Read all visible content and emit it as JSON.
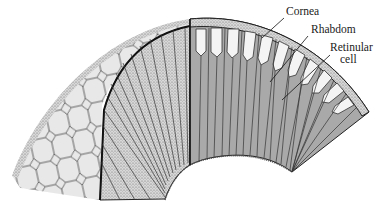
{
  "figure": {
    "labels": [
      {
        "id": "cornea",
        "text": "Cornea",
        "x": 286,
        "y": 12
      },
      {
        "id": "rhabdom",
        "text": "Rhabdom",
        "x": 310,
        "y": 30
      },
      {
        "id": "retinular",
        "text": "Retinular",
        "x": 330,
        "y": 47
      },
      {
        "id": "retinular2",
        "text": "cell",
        "x": 340,
        "y": 59
      }
    ],
    "colors": {
      "ink": "#2a2a2a",
      "hex_fill": "#e6e6e6",
      "stipple": "#bdbdbd",
      "section_fill": "#a8a8a8",
      "cell_white": "#f4f4f4"
    }
  }
}
